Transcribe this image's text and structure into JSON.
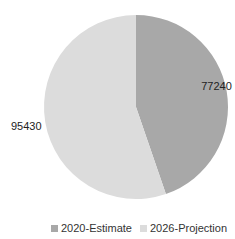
{
  "chart_data": {
    "type": "pie",
    "title": "",
    "categories": [
      "2020-Estimate",
      "2026-Projection"
    ],
    "values": [
      77240,
      95430
    ],
    "colors": [
      "#a8a8a8",
      "#dcdcdc"
    ],
    "data_labels": [
      "77240",
      "95430"
    ],
    "legend": {
      "position": "bottom",
      "entries": [
        "2020-Estimate",
        "2026-Projection"
      ]
    },
    "start_angle": "top",
    "direction": "clockwise"
  }
}
